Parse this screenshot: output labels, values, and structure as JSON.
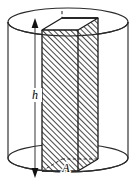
{
  "figure": {
    "type": "geometry-diagram",
    "canvas": {
      "width": 136,
      "height": 185,
      "background": "#ffffff"
    },
    "labels": {
      "height_label": "h",
      "area_label": "A"
    },
    "colors": {
      "stroke": "#1a1a1a",
      "cylinder_stroke": "#2b2b2b",
      "hatch": "#3a3a3a",
      "face_fill": "#ffffff",
      "background": "#ffffff"
    },
    "shapes": {
      "cylinder": {
        "name": "cylinder",
        "center_x": 68,
        "radius_x": 60,
        "radius_y": 14,
        "top_center_y": 22,
        "bottom_center_y": 158
      },
      "prism": {
        "name": "rectangular-prism",
        "front_left_x": 42,
        "front_right_x": 78,
        "top_front_y": 30,
        "bottom_front_y": 171,
        "depth_dx": 20,
        "depth_dy": -12,
        "hatched": true
      },
      "dimension_line": {
        "name": "height-dimension",
        "x": 35,
        "top_y": 22,
        "bottom_y": 174,
        "double_headed": true
      },
      "hidden_edge": {
        "name": "hidden-back-edge",
        "x": 62,
        "top_y": 18,
        "bottom_y": 165,
        "dashed": true
      }
    }
  }
}
